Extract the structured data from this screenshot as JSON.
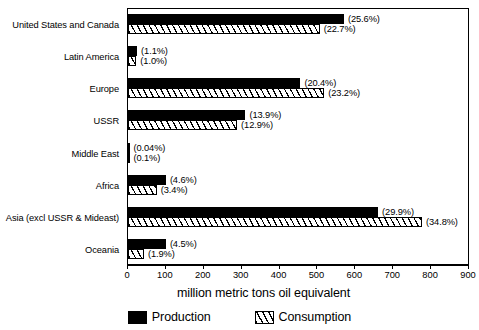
{
  "chart_data": {
    "type": "bar",
    "orientation": "horizontal",
    "title": "",
    "xlabel": "million metric tons oil equivalent",
    "ylabel": "",
    "xlim": [
      0,
      900
    ],
    "xticks": [
      0,
      100,
      200,
      300,
      400,
      500,
      600,
      700,
      800,
      900
    ],
    "grid": false,
    "legend_position": "bottom-center",
    "categories": [
      "United States and Canada",
      "Latin America",
      "Europe",
      "USSR",
      "Middle East",
      "Africa",
      "Asia (excl USSR & Mideast)",
      "Oceania"
    ],
    "series": [
      {
        "name": "Production",
        "color": "#000000",
        "pattern": "solid",
        "values": [
          570,
          24,
          455,
          310,
          1,
          100,
          660,
          100
        ],
        "labels": [
          "(25.6%)",
          "(1.1%)",
          "(20.4%)",
          "(13.9%)",
          "(0.04%)",
          "(4.6%)",
          "(29.9%)",
          "(4.5%)"
        ]
      },
      {
        "name": "Consumption",
        "color": "#ffffff",
        "pattern": "diagonal-hatch",
        "values": [
          506,
          22,
          518,
          288,
          2,
          76,
          776,
          42
        ],
        "labels": [
          "(22.7%)",
          "(1.0%)",
          "(23.2%)",
          "(12.9%)",
          "(0.1%)",
          "(3.4%)",
          "(34.8%)",
          "(1.9%)"
        ]
      }
    ]
  },
  "legend": {
    "items": [
      {
        "label": "Production",
        "swatch": "solid-black-swatch"
      },
      {
        "label": "Consumption",
        "swatch": "diagonal-hatch-swatch"
      }
    ]
  },
  "axis": {
    "x_title": "million metric tons oil equivalent",
    "tick_labels": [
      "0",
      "100",
      "200",
      "300",
      "400",
      "500",
      "600",
      "700",
      "800",
      "900"
    ]
  },
  "colors": {
    "production": "#000000",
    "consumption_fill": "#ffffff",
    "hatch": "#000000",
    "frame": "#000000",
    "background": "#ffffff"
  }
}
